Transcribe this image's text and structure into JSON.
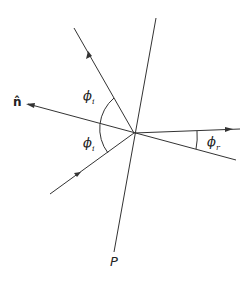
{
  "diagram": {
    "type": "reflection-refraction geometry",
    "labels": {
      "normal": "n̂",
      "phi_i_upper": "ϕ",
      "phi_i_upper_sub": "i",
      "phi_i_lower": "ϕ",
      "phi_i_lower_sub": "i",
      "phi_r": "ϕ",
      "phi_r_sub": "r",
      "plane": "P"
    },
    "colors": {
      "stroke": "#333333",
      "background": "#ffffff"
    }
  }
}
